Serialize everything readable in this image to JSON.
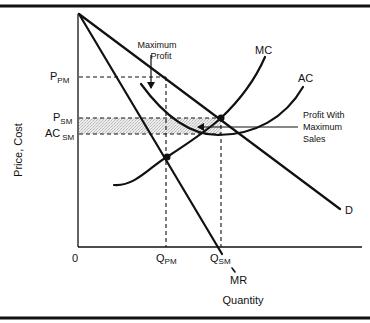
{
  "diagram": {
    "title_fragment": "",
    "y_axis_label": "Price, Cost",
    "x_axis_label": "Quantity",
    "origin_label": "0",
    "price_labels": [
      {
        "main": "P",
        "sub": "PM"
      },
      {
        "main": "P",
        "sub": "SM"
      },
      {
        "main": "AC",
        "sub": "SM"
      }
    ],
    "quantity_labels": [
      {
        "main": "Q",
        "sub": "PM"
      },
      {
        "main": "Q",
        "sub": "SM"
      }
    ],
    "curve_labels": {
      "mc": "MC",
      "ac": "AC",
      "demand": "D",
      "mr": "MR"
    },
    "annotations": {
      "max_profit_line1": "Maximum",
      "max_profit_line2": "Profit",
      "max_sales_line1": "Profit With",
      "max_sales_line2": "Maximum",
      "max_sales_line3": "Sales"
    },
    "colors": {
      "line": "#111111",
      "shade": "#d9d9d9",
      "background": "#ffffff"
    }
  }
}
